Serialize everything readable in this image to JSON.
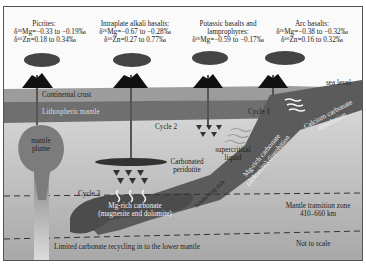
{
  "diagram": {
    "title_regions": [
      {
        "name": "Picrites:",
        "mg": "δ²⁶Mg=−0.33 to −0.19‰",
        "zn": "δ⁶⁶Zn=0.18 to 0.34‰"
      },
      {
        "name": "Intraplate alkali basalts:",
        "mg": "δ²⁶Mg=−0.67 to −0.28‰",
        "zn": "δ⁶⁶Zn=0.27 to 0.77‰"
      },
      {
        "name": "Potassic basalts  and",
        "name2": "lamprophyres:",
        "mg": "δ²⁶Mg=−0.59 to −0.17‰"
      },
      {
        "name": "Arc basalts:",
        "mg": "δ²⁶Mg=−0.38 to −0.32‰",
        "zn": "δ⁶⁶Zn=0.16 to 0.32‰"
      }
    ],
    "labels": {
      "sea_level": "sea level",
      "continental_crust": "Continental crust",
      "lithospheric_mantle": "Lithospheric mantle",
      "mantle_plume_1": "mantle",
      "mantle_plume_2": "plume",
      "cycle_1": "Cycle 1",
      "cycle_2": "Cycle 2",
      "cycle_3": "Cycle 3",
      "carbonated_1": "Carbonated",
      "carbonated_2": "peridotite",
      "supercritical_1": "supercritical",
      "supercritical_2": "liquid",
      "calcium_1": "Calcium carbonate",
      "calcium_2": "dissolution",
      "mgrich_slab_1": "Mg-rich carbonate",
      "mgrich_slab_2": "(dolomite) dissolution",
      "subducting_slab": "Subducting slab",
      "mg_carbonate_1": "Mg-rich carbonate",
      "mg_carbonate_2": "(magnesite and dolomite)",
      "transition_1": "Mantle transition zone",
      "transition_2": "410–660 km",
      "limited": "Limited carbonate recycling in to the lower mantle",
      "not_to_scale": "Not to scale"
    },
    "colors": {
      "continental_crust": "#9a9a9a",
      "lithospheric_mantle": "#6e6e6e",
      "mantle": "#c8c8c8",
      "slab": "#5a5a5a",
      "volcano": "#111111",
      "plume": "#7a7a7a"
    }
  }
}
